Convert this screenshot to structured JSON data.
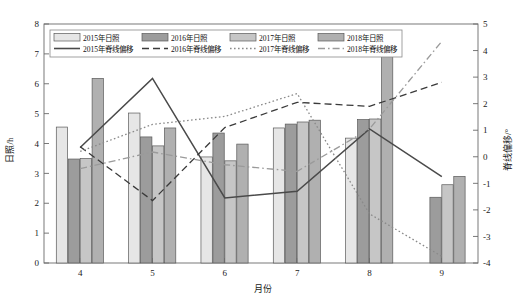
{
  "chart_data": {
    "type": "bar",
    "title": "",
    "xlabel": "月份",
    "ylabel": "日照/h",
    "y2label": "脊线偏移/°",
    "categories": [
      "4",
      "5",
      "6",
      "7",
      "8",
      "9"
    ],
    "ylim": [
      0,
      8
    ],
    "y2lim": [
      -4,
      5
    ],
    "yticks": [
      "0",
      "1",
      "2",
      "3",
      "4",
      "5",
      "6",
      "7",
      "8"
    ],
    "y2ticks": [
      "-4",
      "-3",
      "-2",
      "-1",
      "0",
      "1",
      "2",
      "3",
      "4",
      "5"
    ],
    "grid": false,
    "legend_position": "top-left",
    "bar_series": [
      {
        "name": "2015年日照",
        "color": "#e6e6e6",
        "values": [
          4.55,
          5.02,
          3.55,
          4.52,
          4.18,
          0.0
        ]
      },
      {
        "name": "2016年日照",
        "color": "#9c9c9c",
        "values": [
          3.48,
          4.22,
          4.35,
          4.65,
          4.8,
          2.2
        ]
      },
      {
        "name": "2017年日照",
        "color": "#c6c6c6",
        "values": [
          3.5,
          3.92,
          3.42,
          4.72,
          4.82,
          2.62
        ]
      },
      {
        "name": "2018年日照",
        "color": "#b0b0b0",
        "values": [
          6.18,
          4.52,
          3.98,
          4.78,
          7.32,
          2.9
        ]
      }
    ],
    "line_series": [
      {
        "name": "2015年脊线偏移",
        "style": "solid",
        "color": "#4a4a4a",
        "values": [
          0.35,
          2.95,
          -1.55,
          -1.3,
          1.05,
          -0.75
        ]
      },
      {
        "name": "2016年脊线偏移",
        "style": "dashed",
        "color": "#3a3a3a",
        "values": [
          0.38,
          -1.65,
          1.1,
          2.05,
          1.9,
          2.8
        ]
      },
      {
        "name": "2017年脊线偏移",
        "style": "dotted",
        "color": "#8a8a8a",
        "values": [
          0.2,
          1.22,
          1.52,
          2.38,
          -2.15,
          -3.75
        ]
      },
      {
        "name": "2018年脊线偏移",
        "style": "dashdot",
        "color": "#9a9a9a",
        "values": [
          -0.45,
          0.18,
          -0.3,
          -0.55,
          1.05,
          4.35
        ]
      }
    ]
  },
  "legend": {
    "bars": [
      "2015年日照",
      "2016年日照",
      "2017年日照",
      "2018年日照"
    ],
    "lines": [
      "2015年脊线偏移",
      "2016年脊线偏移",
      "2017年脊线偏移",
      "2018年脊线偏移"
    ]
  },
  "axes": {
    "left_title": "日照/h",
    "right_title": "脊线偏移/°",
    "bottom_title": "月份"
  }
}
